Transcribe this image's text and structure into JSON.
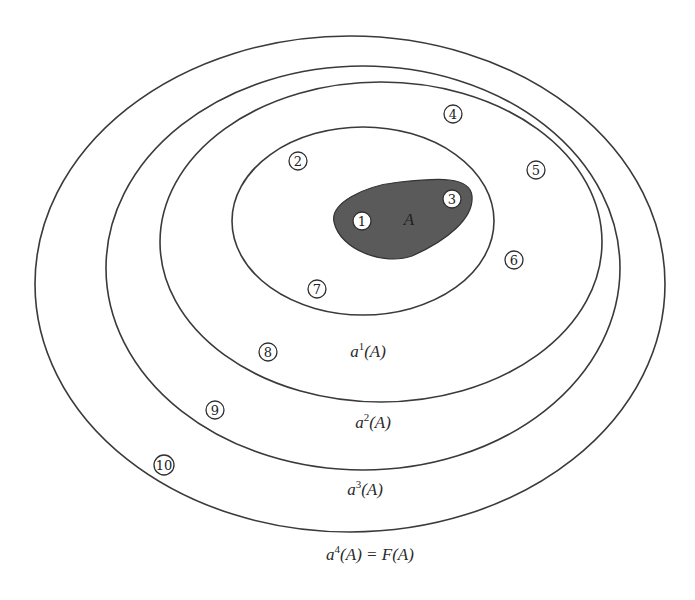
{
  "diagram": {
    "set_label": "A",
    "set_color": "#5a5a5a",
    "line_color": "#3a3a3a",
    "rings": [
      {
        "id": "a1",
        "cx": 363,
        "cy": 221,
        "rx": 131,
        "ry": 94,
        "label_base": "a",
        "label_sup": "1",
        "label_rest": "(A)",
        "label_x": 368,
        "label_y": 357
      },
      {
        "id": "a2",
        "cx": 381,
        "cy": 242,
        "rx": 221,
        "ry": 160,
        "label_base": "a",
        "label_sup": "2",
        "label_rest": "(A)",
        "label_x": 373,
        "label_y": 428
      },
      {
        "id": "a3",
        "cx": 363,
        "cy": 268,
        "rx": 257,
        "ry": 202,
        "label_base": "a",
        "label_sup": "3",
        "label_rest": "(A)",
        "label_x": 365,
        "label_y": 495
      },
      {
        "id": "a4",
        "cx": 350,
        "cy": 284,
        "rx": 315,
        "ry": 248,
        "label_base": "a",
        "label_sup": "4",
        "label_rest": "(A) = F(A)",
        "label_x": 370,
        "label_y": 560
      }
    ],
    "nodes": [
      {
        "n": "1",
        "x": 362,
        "y": 221
      },
      {
        "n": "2",
        "x": 298,
        "y": 161
      },
      {
        "n": "3",
        "x": 452,
        "y": 199
      },
      {
        "n": "4",
        "x": 453,
        "y": 114
      },
      {
        "n": "5",
        "x": 536,
        "y": 170
      },
      {
        "n": "6",
        "x": 514,
        "y": 260
      },
      {
        "n": "7",
        "x": 317,
        "y": 289
      },
      {
        "n": "8",
        "x": 268,
        "y": 352
      },
      {
        "n": "9",
        "x": 215,
        "y": 410
      },
      {
        "n": "10",
        "x": 164,
        "y": 465
      }
    ]
  }
}
